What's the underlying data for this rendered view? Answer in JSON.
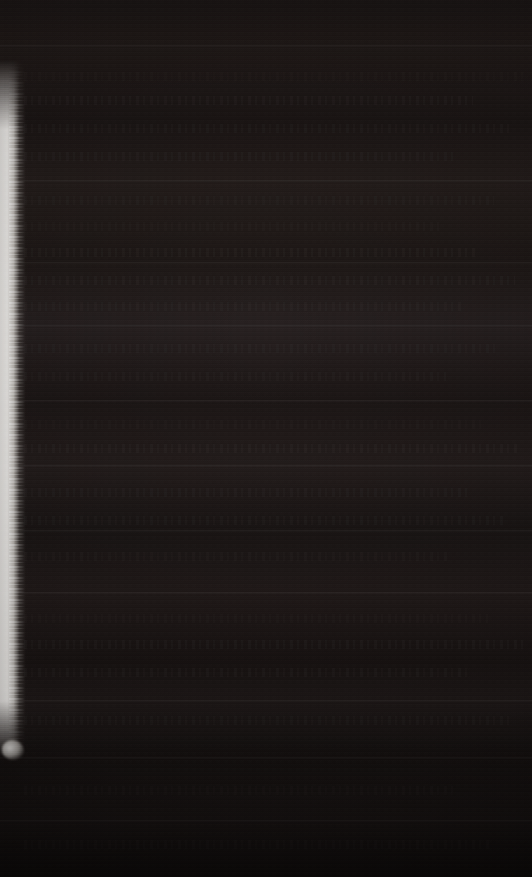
{
  "image": {
    "kind": "near-black underexposed scan",
    "width": 532,
    "height": 877,
    "background_color": "#191413",
    "tint": "warm reddish-brown",
    "legible_text": "",
    "notes_visible_content": "no readable glyphs, no UI chrome"
  },
  "regions": {
    "edge_band": {
      "name": "left-edge-light-band",
      "color": "#fbf9f6",
      "x": 0,
      "width": 26,
      "top": 60,
      "bottom": 757,
      "edge": "ragged feathered grainy"
    },
    "edge_blob": {
      "name": "edge-band-terminal-blob",
      "color": "#fffdfa",
      "x": 2,
      "y": 740,
      "width": 22,
      "height": 20
    }
  },
  "seams": [
    {
      "label": "seam-01",
      "y": 45,
      "tone": "#241d1b"
    },
    {
      "label": "seam-02",
      "y": 180,
      "tone": "#261f1d"
    },
    {
      "label": "seam-03",
      "y": 262,
      "tone": "#1f1917"
    },
    {
      "label": "seam-04",
      "y": 325,
      "tone": "#2a2322"
    },
    {
      "label": "seam-05",
      "y": 400,
      "tone": "#1d1716"
    },
    {
      "label": "seam-06",
      "y": 465,
      "tone": "#261f1e"
    },
    {
      "label": "seam-07",
      "y": 530,
      "tone": "#1b1615"
    },
    {
      "label": "seam-08",
      "y": 592,
      "tone": "#241d1c"
    },
    {
      "label": "seam-09",
      "y": 700,
      "tone": "#201a19"
    },
    {
      "label": "seam-10",
      "y": 757,
      "tone": "#181312"
    },
    {
      "label": "seam-11",
      "y": 820,
      "tone": "#1d1716"
    }
  ],
  "row_ghosts": [
    {
      "label": "ghost-row-01",
      "y": 72
    },
    {
      "label": "ghost-row-02",
      "y": 96
    },
    {
      "label": "ghost-row-03",
      "y": 124
    },
    {
      "label": "ghost-row-04",
      "y": 152
    },
    {
      "label": "ghost-row-05",
      "y": 196
    },
    {
      "label": "ghost-row-06",
      "y": 222
    },
    {
      "label": "ghost-row-07",
      "y": 248
    },
    {
      "label": "ghost-row-08",
      "y": 276
    },
    {
      "label": "ghost-row-09",
      "y": 302
    },
    {
      "label": "ghost-row-10",
      "y": 344
    },
    {
      "label": "ghost-row-11",
      "y": 372
    },
    {
      "label": "ghost-row-12",
      "y": 420
    },
    {
      "label": "ghost-row-13",
      "y": 444
    },
    {
      "label": "ghost-row-14",
      "y": 488
    },
    {
      "label": "ghost-row-15",
      "y": 516
    },
    {
      "label": "ghost-row-16",
      "y": 552
    },
    {
      "label": "ghost-row-17",
      "y": 614
    },
    {
      "label": "ghost-row-18",
      "y": 640
    },
    {
      "label": "ghost-row-19",
      "y": 668
    },
    {
      "label": "ghost-row-20",
      "y": 716
    },
    {
      "label": "ghost-row-21",
      "y": 786
    },
    {
      "label": "ghost-row-22",
      "y": 840
    }
  ]
}
